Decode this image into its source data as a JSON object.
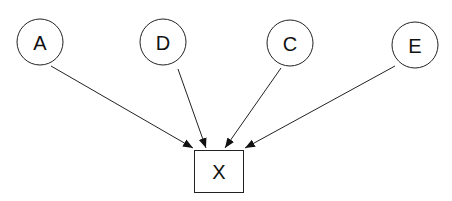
{
  "diagram": {
    "type": "directed-graph",
    "nodes": [
      {
        "id": "A",
        "label": "A",
        "shape": "circle",
        "cx": 40,
        "cy": 42,
        "r": 23
      },
      {
        "id": "D",
        "label": "D",
        "shape": "circle",
        "cx": 163,
        "cy": 42,
        "r": 23
      },
      {
        "id": "C",
        "label": "C",
        "shape": "circle",
        "cx": 290,
        "cy": 43,
        "r": 23
      },
      {
        "id": "E",
        "label": "E",
        "shape": "circle",
        "cx": 415,
        "cy": 45,
        "r": 23
      },
      {
        "id": "X",
        "label": "X",
        "shape": "box",
        "x": 194,
        "y": 150,
        "w": 49,
        "h": 42
      }
    ],
    "edges": [
      {
        "from": "A",
        "to": "X"
      },
      {
        "from": "D",
        "to": "X"
      },
      {
        "from": "C",
        "to": "X"
      },
      {
        "from": "E",
        "to": "X"
      }
    ]
  }
}
